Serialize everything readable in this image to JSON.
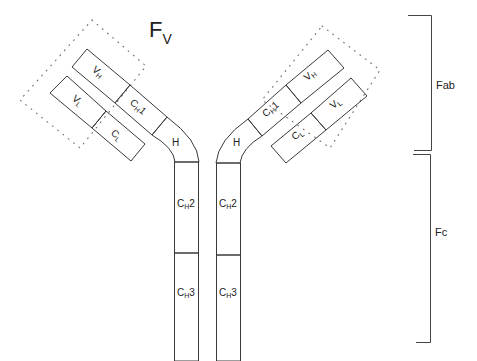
{
  "title": {
    "main": "F",
    "sub": "V"
  },
  "left_arm": {
    "heavy": [
      {
        "main": "V",
        "sub": "H",
        "suffix": ""
      },
      {
        "main": "C",
        "sub": "H",
        "suffix": "1"
      }
    ],
    "light": [
      {
        "main": "V",
        "sub": "L",
        "suffix": ""
      },
      {
        "main": "C",
        "sub": "L",
        "suffix": ""
      }
    ],
    "hinge": "H"
  },
  "right_arm": {
    "heavy": [
      {
        "main": "V",
        "sub": "H",
        "suffix": ""
      },
      {
        "main": "C",
        "sub": "H",
        "suffix": "1"
      }
    ],
    "light": [
      {
        "main": "V",
        "sub": "L",
        "suffix": ""
      },
      {
        "main": "C",
        "sub": "L",
        "suffix": ""
      }
    ],
    "hinge": "H"
  },
  "stems": {
    "left": [
      {
        "main": "C",
        "sub": "H",
        "suffix": "2"
      },
      {
        "main": "C",
        "sub": "H",
        "suffix": "3"
      }
    ],
    "right": [
      {
        "main": "C",
        "sub": "H",
        "suffix": "2"
      },
      {
        "main": "C",
        "sub": "H",
        "suffix": "3"
      }
    ]
  },
  "brackets": [
    {
      "label": "Fab"
    },
    {
      "label": "Fc"
    }
  ]
}
